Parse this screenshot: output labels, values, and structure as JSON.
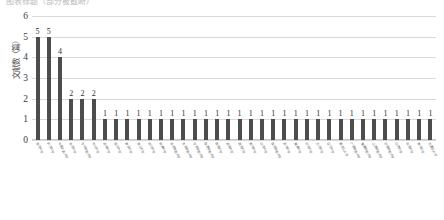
{
  "title_strip": {
    "text": "图表标题（部分被截断）"
  },
  "chart_data": {
    "type": "bar",
    "title": "",
    "xlabel": "",
    "ylabel": "文献数（篇）",
    "ylim": [
      0,
      6
    ],
    "yticks": [
      0,
      1,
      2,
      3,
      4,
      5,
      6
    ],
    "grid": true,
    "legend": "none",
    "bar_color": "#4d4d4d",
    "gridline_color": "#d9d9d9",
    "show_value_labels": true,
    "categories": [
      "南京大学",
      "武汉大学",
      "中国人民大学",
      "北京大学",
      "华中师范大学",
      "中山大学",
      "吉林大学",
      "南开大学",
      "复旦大学",
      "浙江大学",
      "四川大学",
      "安徽大学",
      "北京师范大学",
      "东北师范大学",
      "华东师范大学",
      "陕西师范大学",
      "西南大学",
      "湖南大学",
      "湖北大学",
      "郑州大学",
      "山东大学",
      "南京师范大学",
      "苏州大学",
      "湘潭大学",
      "河北大学",
      "兰州大学",
      "辽宁大学",
      "黑龙江大学",
      "广西师范大学",
      "福建师范大学",
      "江西师范大学",
      "河南师范大学",
      "山西大学",
      "云南大学",
      "贵州大学",
      "内蒙古大学"
    ],
    "values": [
      5,
      5,
      4,
      2,
      2,
      2,
      1,
      1,
      1,
      1,
      1,
      1,
      1,
      1,
      1,
      1,
      1,
      1,
      1,
      1,
      1,
      1,
      1,
      1,
      1,
      1,
      1,
      1,
      1,
      1,
      1,
      1,
      1,
      1,
      1,
      1
    ]
  }
}
